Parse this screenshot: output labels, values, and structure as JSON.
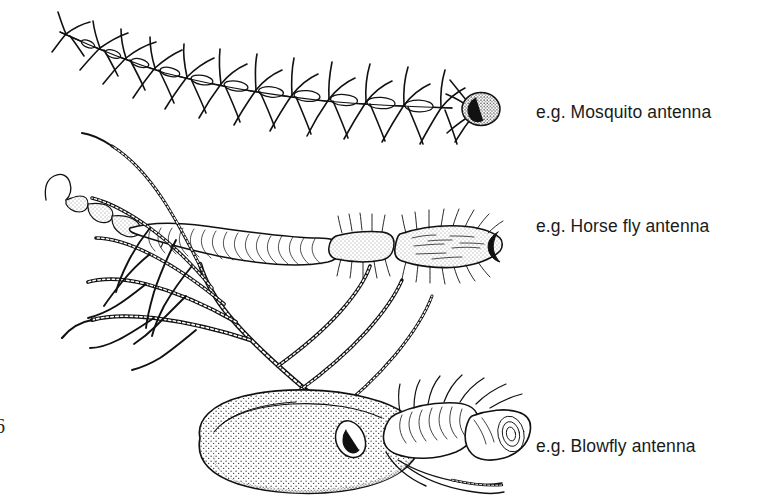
{
  "figure": {
    "background_color": "#ffffff",
    "ink_color": "#111111",
    "page_number": "6",
    "specimens": [
      {
        "id": "mosquito",
        "label": "e.g. Mosquito antenna",
        "antenna_type": "plumose",
        "segment_count": 12,
        "description": "Slender flagellum of bead-like segments, each bearing a whorl of long hairs; ends in a rounded stippled pedicel at the right.",
        "orientation": "tip at upper left, base at right"
      },
      {
        "id": "horse-fly",
        "label": "e.g. Horse fly antenna",
        "antenna_type": "stylate",
        "segment_count": 3,
        "description": "Three-part antenna: small annulated terminal stylus at left, large curved ridged flagellum, then two bristly basal segments with a notched base.",
        "orientation": "tip at upper left, base at right"
      },
      {
        "id": "blowfly",
        "label": "e.g. Blowfly antenna",
        "antenna_type": "aristate",
        "segment_count": 3,
        "description": "Large oval stippled flagellum with a long plumose arista bearing many branched rays, and bristly pedicel and scape at the right.",
        "orientation": "arista sweeping to upper left, base at lower right"
      }
    ],
    "labels": {
      "mosquito": "e.g. Mosquito antenna",
      "horse_fly": "e.g. Horse fly antenna",
      "blowfly": "e.g. Blowfly antenna"
    }
  }
}
